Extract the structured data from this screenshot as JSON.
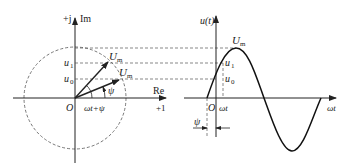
{
  "phasor_diagram": {
    "axis_imag_label_prefix": "+j",
    "axis_imag_label": "Im",
    "axis_real_label": "Re",
    "axis_real_unit": "+1",
    "origin_label": "O",
    "vector_label_1": "U",
    "vector_label_1_sub": "m",
    "vector_label_2": "U",
    "vector_label_2_sub": "m",
    "u1_label": "u",
    "u1_sub": "1",
    "u0_label": "u",
    "u0_sub": "0",
    "angle_psi": "ψ",
    "angle_total": "ωt+ψ"
  },
  "waveform": {
    "y_axis_label": "u(t)",
    "x_axis_label": "ωt",
    "peak_label": "U",
    "peak_sub": "m",
    "u1_label": "u",
    "u1_sub": "1",
    "u0_label": "u",
    "u0_sub": "0",
    "origin_label": "O",
    "omega_t_label": "ωt",
    "phase_label": "ψ"
  }
}
